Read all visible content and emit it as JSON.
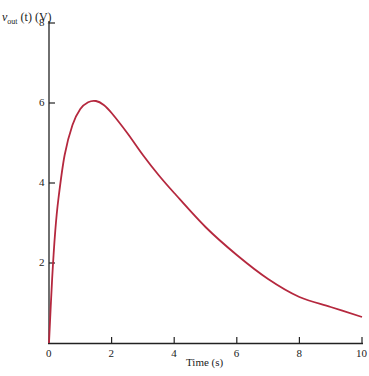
{
  "chart_data": {
    "type": "line",
    "title": "",
    "xlabel": "Time (s)",
    "ylabel": "v_out(t) (V)",
    "ylabel_parts": {
      "var": "v",
      "sub": "out",
      "arg": "(t)",
      "unit": "(V)"
    },
    "xlim": [
      0,
      10
    ],
    "ylim": [
      0,
      8
    ],
    "xticks": [
      "0",
      "2",
      "4",
      "6",
      "8",
      "10"
    ],
    "yticks": [
      "2",
      "4",
      "6",
      "8"
    ],
    "grid": false,
    "legend": null,
    "line_color": "#b5283e",
    "series": [
      {
        "name": "v_out(t)",
        "x": [
          0,
          0.1,
          0.2,
          0.3,
          0.5,
          0.75,
          1.0,
          1.25,
          1.5,
          1.75,
          2.0,
          2.5,
          3.0,
          3.5,
          4.0,
          5.0,
          6.0,
          7.0,
          8.0,
          9.0,
          10.0
        ],
        "y": [
          0,
          1.6,
          2.8,
          3.6,
          4.7,
          5.45,
          5.85,
          6.02,
          6.05,
          5.95,
          5.75,
          5.25,
          4.7,
          4.2,
          3.75,
          2.9,
          2.2,
          1.6,
          1.15,
          0.9,
          0.65
        ]
      }
    ]
  }
}
